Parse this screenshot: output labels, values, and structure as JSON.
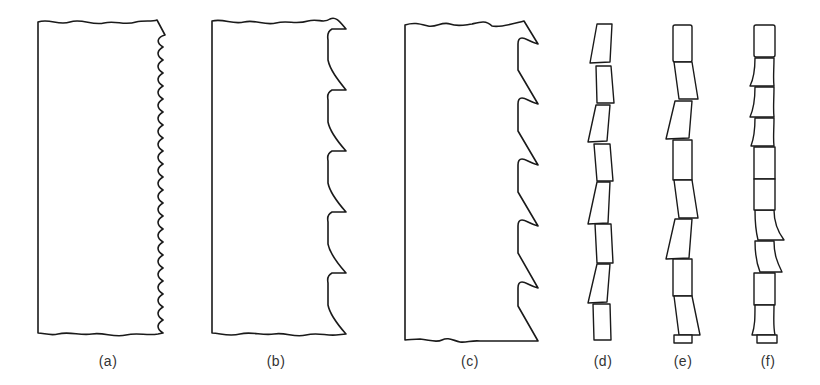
{
  "figure": {
    "stroke_color": "#1a1a1a",
    "background": "#ffffff",
    "panels": [
      {
        "id": "a",
        "label": "(a)",
        "kind": "tooth-form",
        "tooth_style": "fine wavy",
        "label_x": 108
      },
      {
        "id": "b",
        "label": "(b)",
        "kind": "tooth-form",
        "tooth_style": "regular tooth",
        "tooth_count": 6,
        "label_x": 276
      },
      {
        "id": "c",
        "label": "(c)",
        "kind": "tooth-form",
        "tooth_style": "hook tooth",
        "tooth_count": 5,
        "label_x": 470
      },
      {
        "id": "d",
        "label": "(d)",
        "kind": "tooth-set",
        "set_style": "alternate set",
        "label_x": 603
      },
      {
        "id": "e",
        "label": "(e)",
        "kind": "tooth-set",
        "set_style": "raker set",
        "label_x": 683
      },
      {
        "id": "f",
        "label": "(f)",
        "kind": "tooth-set",
        "set_style": "wavy set",
        "label_x": 768
      }
    ]
  }
}
